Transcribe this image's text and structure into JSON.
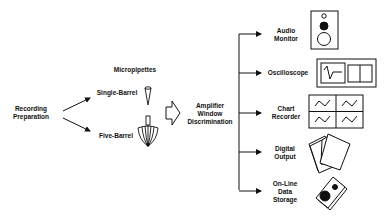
{
  "diagram": {
    "source_node": {
      "line1": "Recording",
      "line2": "Preparation"
    },
    "micropipettes": {
      "title": "Micropipettes",
      "single": "Single-Barrel",
      "five": "Five-Barrel"
    },
    "amplifier": {
      "line1": "Amplifier",
      "line2": "Window",
      "line3": "Discrimination"
    },
    "outputs": [
      {
        "line1": "Audio",
        "line2": "Monitor",
        "icon": "speaker-icon"
      },
      {
        "line1": "Oscilloscope",
        "icon": "oscilloscope-icon"
      },
      {
        "line1": "Chart",
        "line2": "Recorder",
        "icon": "chart-recorder-icon"
      },
      {
        "line1": "Digital",
        "line2": "Output",
        "icon": "paper-sheets-icon"
      },
      {
        "line1": "On-Line",
        "line2": "Data",
        "line3": "Storage",
        "icon": "disk-cartridge-icon"
      }
    ]
  },
  "colors": {
    "ink": "#111111",
    "background": "#ffffff"
  }
}
